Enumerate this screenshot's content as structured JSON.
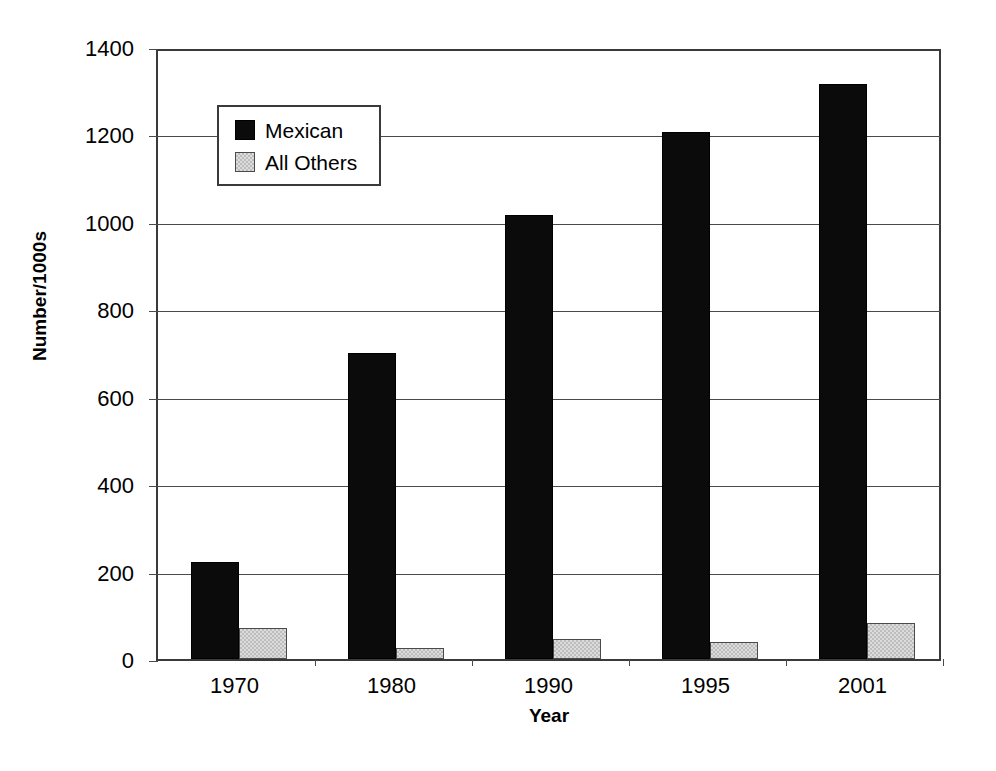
{
  "chart_data": {
    "type": "bar",
    "title": "",
    "xlabel": "Year",
    "ylabel": "Number/1000s",
    "categories": [
      "1970",
      "1980",
      "1990",
      "1995",
      "2001"
    ],
    "series": [
      {
        "name": "Mexican",
        "color": "#0b0b0b",
        "values": [
          223,
          700,
          1015,
          1205,
          1315
        ]
      },
      {
        "name": "All Others",
        "color": "#dcdcdc",
        "values": [
          70,
          25,
          45,
          38,
          82
        ]
      }
    ],
    "ylim": [
      0,
      1400
    ],
    "yticks": [
      0,
      200,
      400,
      600,
      800,
      1000,
      1200,
      1400
    ],
    "ytick_labels": [
      "0",
      "200",
      "400",
      "600",
      "800",
      "1000",
      "1200",
      "1400"
    ],
    "grid": true,
    "grid_axis": "y",
    "legend_position": "upper-left-inside",
    "legend_entries": [
      "Mexican",
      "All Others"
    ],
    "bar_orientation": "vertical",
    "background_color": "#ffffff",
    "axis_color": "#3a3a3a"
  }
}
